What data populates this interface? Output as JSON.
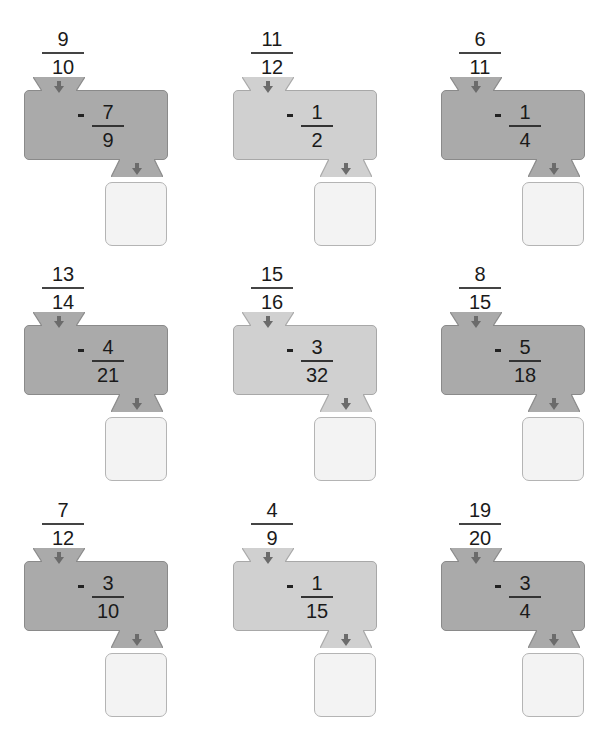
{
  "worksheet": {
    "operation": "subtract",
    "colors": {
      "dark_box": "#aaaaaa",
      "light_box": "#d0d0d0",
      "answer_box": "#f3f3f3",
      "arrow": "#6b6b6b"
    },
    "machines": [
      {
        "input": {
          "num": "9",
          "den": "10"
        },
        "operator": "-",
        "operand": {
          "num": "7",
          "den": "9"
        },
        "style": "dark",
        "answer": ""
      },
      {
        "input": {
          "num": "11",
          "den": "12"
        },
        "operator": "-",
        "operand": {
          "num": "1",
          "den": "2"
        },
        "style": "light",
        "answer": ""
      },
      {
        "input": {
          "num": "6",
          "den": "11"
        },
        "operator": "-",
        "operand": {
          "num": "1",
          "den": "4"
        },
        "style": "dark",
        "answer": ""
      },
      {
        "input": {
          "num": "13",
          "den": "14"
        },
        "operator": "-",
        "operand": {
          "num": "4",
          "den": "21"
        },
        "style": "dark",
        "answer": ""
      },
      {
        "input": {
          "num": "15",
          "den": "16"
        },
        "operator": "-",
        "operand": {
          "num": "3",
          "den": "32"
        },
        "style": "light",
        "answer": ""
      },
      {
        "input": {
          "num": "8",
          "den": "15"
        },
        "operator": "-",
        "operand": {
          "num": "5",
          "den": "18"
        },
        "style": "dark",
        "answer": ""
      },
      {
        "input": {
          "num": "7",
          "den": "12"
        },
        "operator": "-",
        "operand": {
          "num": "3",
          "den": "10"
        },
        "style": "dark",
        "answer": ""
      },
      {
        "input": {
          "num": "4",
          "den": "9"
        },
        "operator": "-",
        "operand": {
          "num": "1",
          "den": "15"
        },
        "style": "light",
        "answer": ""
      },
      {
        "input": {
          "num": "19",
          "den": "20"
        },
        "operator": "-",
        "operand": {
          "num": "3",
          "den": "4"
        },
        "style": "dark",
        "answer": ""
      }
    ]
  }
}
